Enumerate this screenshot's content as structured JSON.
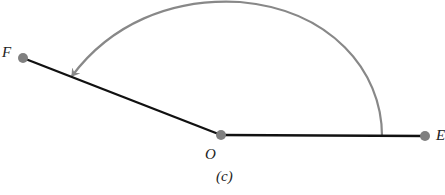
{
  "diagram": {
    "caption": "(c)",
    "points": [
      {
        "id": "F",
        "label": "F",
        "x": 23,
        "y": 58
      },
      {
        "id": "O",
        "label": "O",
        "x": 221,
        "y": 135
      },
      {
        "id": "E",
        "label": "E",
        "x": 425,
        "y": 136
      }
    ],
    "segments": [
      {
        "from": "F",
        "to": "O",
        "color": "#111111"
      },
      {
        "from": "O",
        "to": "E",
        "color": "#111111"
      }
    ],
    "arc": {
      "from_x": 382,
      "from_y": 136,
      "to_x": 72,
      "to_y": 78,
      "color": "#888888",
      "arrow": "end"
    },
    "colors": {
      "line": "#111111",
      "arc": "#888888",
      "point": "#808080"
    }
  }
}
